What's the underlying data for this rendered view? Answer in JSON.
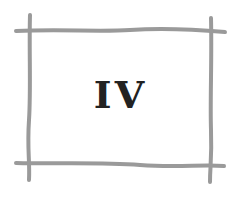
{
  "card": {
    "label": "IV",
    "line_color": "#9a9a9a",
    "text_color": "#222222"
  }
}
